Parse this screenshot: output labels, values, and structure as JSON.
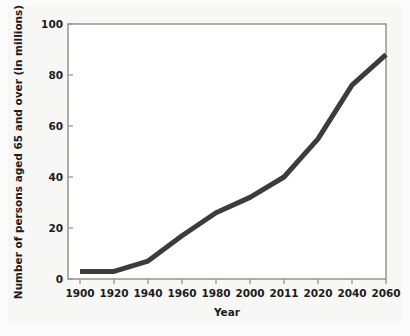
{
  "chart_data": {
    "type": "line",
    "title": "",
    "xlabel": "Year",
    "ylabel": "Number of persons aged 65 and over (in millions)",
    "categories": [
      "1900",
      "1920",
      "1940",
      "1960",
      "1980",
      "2000",
      "2011",
      "2020",
      "2040",
      "2060"
    ],
    "values": [
      3,
      3,
      7,
      17,
      26,
      32,
      40,
      55,
      76,
      88
    ],
    "x_tick_labels": [
      "1900",
      "1920",
      "1940",
      "1960",
      "1980",
      "2000",
      "2011",
      "2020",
      "2040",
      "2060"
    ],
    "y_tick_labels": [
      "0",
      "20",
      "40",
      "60",
      "80",
      "100"
    ],
    "y_ticks": [
      0,
      20,
      40,
      60,
      80,
      100
    ],
    "ylim": [
      0,
      100
    ],
    "grid": false,
    "legend": false,
    "legend_position": "none",
    "line_color": "#3c3c3c",
    "axis_color": "#8a8a8a",
    "text_color": "#1c1c1c",
    "background_color": "#f7f7f6",
    "plot_background_color": "#ffffff"
  },
  "axes": {
    "x_axis_title": "Year",
    "y_axis_title": "Number of persons aged 65 and over (in millions)"
  }
}
